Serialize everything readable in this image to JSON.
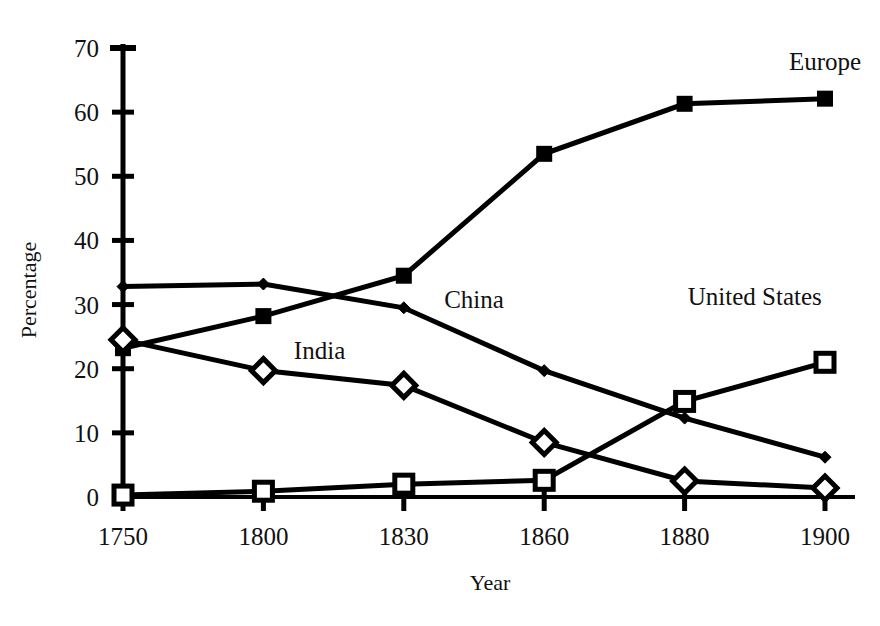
{
  "chart_data": {
    "type": "line",
    "title": "",
    "xlabel": "Year",
    "ylabel": "Percentage",
    "categories": [
      "1750",
      "1800",
      "1830",
      "1860",
      "1880",
      "1900"
    ],
    "ylim": [
      0,
      70
    ],
    "ytick_step": 10,
    "yticks": [
      "0",
      "10",
      "20",
      "30",
      "40",
      "50",
      "60",
      "70"
    ],
    "grid": false,
    "legend_position": "inline-labels",
    "series": [
      {
        "name": "Europe",
        "marker": "filled-square",
        "values": [
          23.2,
          28.2,
          34.5,
          53.5,
          61.3,
          62.1
        ],
        "label": "Europe"
      },
      {
        "name": "China",
        "marker": "small-diamond",
        "values": [
          32.8,
          33.2,
          29.5,
          19.7,
          12.3,
          6.2
        ],
        "label": "China"
      },
      {
        "name": "India",
        "marker": "open-diamond",
        "values": [
          24.5,
          19.7,
          17.4,
          8.5,
          2.5,
          1.4
        ],
        "label": "India"
      },
      {
        "name": "United States",
        "marker": "open-square",
        "values": [
          0.3,
          0.9,
          2.0,
          2.6,
          14.9,
          21.0
        ],
        "label": "United States"
      }
    ],
    "annotations": [
      {
        "text": "Europe",
        "x": 1900,
        "y": 66.5
      },
      {
        "text": "China",
        "x": 1845,
        "y": 29.5
      },
      {
        "text": "India",
        "x": 1812,
        "y": 21.5
      },
      {
        "text": "United States",
        "x": 1890,
        "y": 30.0
      }
    ]
  },
  "axes": {
    "y_label": "Percentage",
    "x_label": "Year"
  }
}
